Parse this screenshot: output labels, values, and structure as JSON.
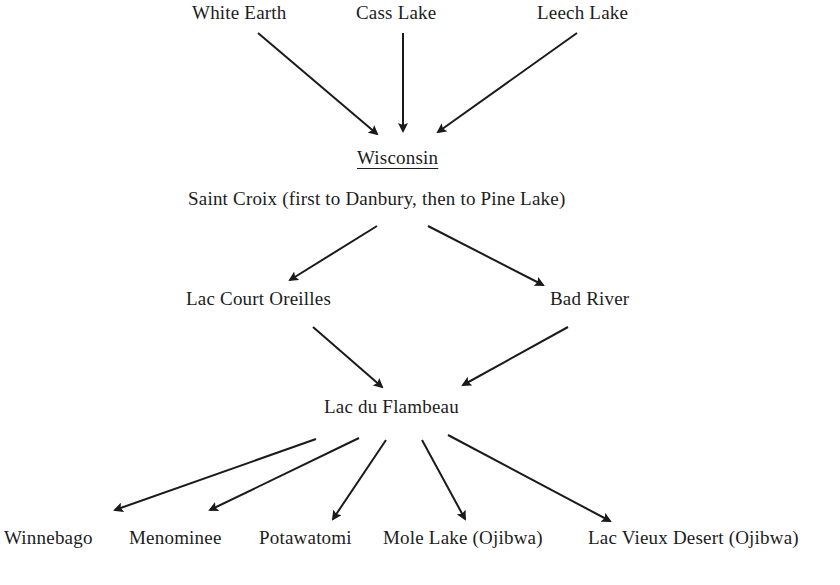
{
  "diagram": {
    "type": "flow",
    "direction": "top-to-bottom",
    "nodes": [
      {
        "id": "white_earth",
        "label": "White Earth",
        "x": 192,
        "y": 2
      },
      {
        "id": "cass_lake",
        "label": "Cass Lake",
        "x": 356,
        "y": 2
      },
      {
        "id": "leech_lake",
        "label": "Leech Lake",
        "x": 537,
        "y": 2
      },
      {
        "id": "wisconsin",
        "label": "Wisconsin",
        "x": 357,
        "y": 147,
        "style": "underlined-heading"
      },
      {
        "id": "saint_croix",
        "label": "Saint Croix (first to Danbury, then to Pine Lake)",
        "x": 188,
        "y": 188
      },
      {
        "id": "lac_court_oreilles",
        "label": "Lac Court Oreilles",
        "x": 186,
        "y": 288
      },
      {
        "id": "bad_river",
        "label": "Bad River",
        "x": 550,
        "y": 288
      },
      {
        "id": "lac_du_flambeau",
        "label": "Lac du Flambeau",
        "x": 324,
        "y": 396
      },
      {
        "id": "winnebago",
        "label": "Winnebago",
        "x": 4,
        "y": 527
      },
      {
        "id": "menominee",
        "label": "Menominee",
        "x": 129,
        "y": 527
      },
      {
        "id": "potawatomi",
        "label": "Potawatomi",
        "x": 259,
        "y": 527
      },
      {
        "id": "mole_lake",
        "label": "Mole Lake (Ojibwa)",
        "x": 383,
        "y": 527
      },
      {
        "id": "lac_vieux_desert",
        "label": "Lac Vieux Desert (Ojibwa)",
        "x": 588,
        "y": 527
      }
    ],
    "edges": [
      {
        "from": "white_earth",
        "to": "wisconsin",
        "x1": 258,
        "y1": 33,
        "x2": 377,
        "y2": 134
      },
      {
        "from": "cass_lake",
        "to": "wisconsin",
        "x1": 403,
        "y1": 33,
        "x2": 403,
        "y2": 131
      },
      {
        "from": "leech_lake",
        "to": "wisconsin",
        "x1": 577,
        "y1": 33,
        "x2": 438,
        "y2": 132
      },
      {
        "from": "saint_croix",
        "to": "lac_court_oreilles",
        "x1": 377,
        "y1": 226,
        "x2": 290,
        "y2": 280
      },
      {
        "from": "saint_croix",
        "to": "bad_river",
        "x1": 428,
        "y1": 226,
        "x2": 543,
        "y2": 285
      },
      {
        "from": "lac_court_oreilles",
        "to": "lac_du_flambeau",
        "x1": 313,
        "y1": 327,
        "x2": 382,
        "y2": 387
      },
      {
        "from": "bad_river",
        "to": "lac_du_flambeau",
        "x1": 568,
        "y1": 327,
        "x2": 463,
        "y2": 385
      },
      {
        "from": "lac_du_flambeau",
        "to": "winnebago",
        "x1": 316,
        "y1": 439,
        "x2": 115,
        "y2": 510
      },
      {
        "from": "lac_du_flambeau",
        "to": "menominee",
        "x1": 359,
        "y1": 438,
        "x2": 210,
        "y2": 510
      },
      {
        "from": "lac_du_flambeau",
        "to": "potawatomi",
        "x1": 386,
        "y1": 440,
        "x2": 333,
        "y2": 519
      },
      {
        "from": "lac_du_flambeau",
        "to": "mole_lake",
        "x1": 422,
        "y1": 440,
        "x2": 465,
        "y2": 519
      },
      {
        "from": "lac_du_flambeau",
        "to": "lac_vieux_desert",
        "x1": 448,
        "y1": 435,
        "x2": 610,
        "y2": 521
      }
    ]
  },
  "colors": {
    "background": "#ffffff",
    "ink": "#1a1a1a"
  }
}
